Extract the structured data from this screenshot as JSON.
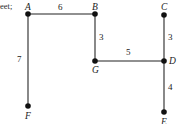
{
  "figure": {
    "width": 180,
    "height": 124,
    "background": "#ffffff",
    "stroke_color": "#6b6b6b",
    "node_color": "#111111",
    "text_color": "#1a1a1a",
    "caption_fragment": "eet;"
  },
  "nodes": [
    {
      "id": "A",
      "label": "A",
      "x": 28,
      "y": 14,
      "label_x": 25,
      "label_y": 3
    },
    {
      "id": "B",
      "label": "B",
      "x": 95,
      "y": 14,
      "label_x": 92,
      "label_y": 3
    },
    {
      "id": "C",
      "label": "C",
      "x": 164,
      "y": 15,
      "label_x": 161,
      "label_y": 3
    },
    {
      "id": "D",
      "label": "D",
      "x": 164,
      "y": 61,
      "label_x": 169,
      "label_y": 57
    },
    {
      "id": "G",
      "label": "G",
      "x": 95,
      "y": 61,
      "label_x": 92,
      "label_y": 66
    },
    {
      "id": "F",
      "label": "F",
      "x": 28,
      "y": 106,
      "label_x": 25,
      "label_y": 112
    },
    {
      "id": "E",
      "label": "E",
      "x": 164,
      "y": 112,
      "label_x": 161,
      "label_y": 118
    }
  ],
  "edges": [
    {
      "from": "A",
      "to": "B",
      "weight": "6",
      "label_x": 58,
      "label_y": 3
    },
    {
      "from": "A",
      "to": "F",
      "weight": "7",
      "label_x": 17,
      "label_y": 55
    },
    {
      "from": "B",
      "to": "G",
      "weight": "3",
      "label_x": 99,
      "label_y": 33
    },
    {
      "from": "G",
      "to": "D",
      "weight": "5",
      "label_x": 126,
      "label_y": 48
    },
    {
      "from": "C",
      "to": "D",
      "weight": "3",
      "label_x": 168,
      "label_y": 33
    },
    {
      "from": "D",
      "to": "E",
      "weight": "4",
      "label_x": 168,
      "label_y": 83
    }
  ]
}
